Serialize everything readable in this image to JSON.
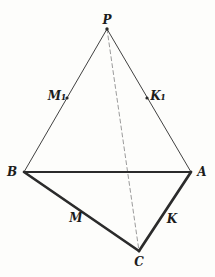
{
  "figure": {
    "background": "#fdfdfb",
    "colors": {
      "solid_line": "#2b2b2b",
      "dashed_line": "#9b9b9b",
      "label_text": "#1c1c1c"
    },
    "vertices": {
      "P": {
        "label": "P",
        "x": 107,
        "y": 29
      },
      "B": {
        "label": "B",
        "x": 24,
        "y": 172
      },
      "A": {
        "label": "A",
        "x": 191,
        "y": 172
      },
      "C": {
        "label": "C",
        "x": 139,
        "y": 251
      }
    },
    "points": {
      "M1": {
        "label": "M₁",
        "x": 67,
        "y": 98,
        "on_edge": "PB"
      },
      "K1": {
        "label": "K₁",
        "x": 147,
        "y": 98,
        "on_edge": "PA"
      }
    },
    "edge_labels": {
      "M": {
        "label": "M",
        "on_edge": "BC"
      },
      "K": {
        "label": "K",
        "on_edge": "AC"
      }
    },
    "edges": [
      {
        "from": "P",
        "to": "C",
        "style": "dashed"
      },
      {
        "from": "P",
        "to": "B",
        "style": "thin"
      },
      {
        "from": "P",
        "to": "A",
        "style": "thin"
      },
      {
        "from": "B",
        "to": "A",
        "style": "medium"
      },
      {
        "from": "B",
        "to": "C",
        "style": "thick"
      },
      {
        "from": "A",
        "to": "C",
        "style": "thick"
      }
    ],
    "markers": [
      {
        "at": "P",
        "r": 1.7
      },
      {
        "at": "M1",
        "r": 1.6
      },
      {
        "at": "K1",
        "r": 1.6
      }
    ]
  }
}
